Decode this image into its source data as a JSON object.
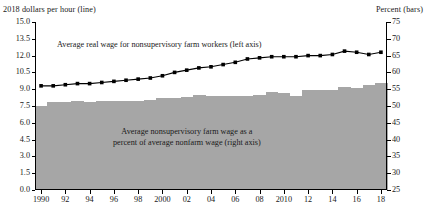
{
  "chart_data": {
    "type": "bar",
    "title": "",
    "left_axis_title": "2018 dollars per hour (line)",
    "right_axis_title": "Percent (bars)",
    "xlabel": "",
    "categories": [
      1990,
      1991,
      1992,
      1993,
      1994,
      1995,
      1996,
      1997,
      1998,
      1999,
      2000,
      2001,
      2002,
      2003,
      2004,
      2005,
      2006,
      2007,
      2008,
      2009,
      2010,
      2011,
      2012,
      2013,
      2014,
      2015,
      2016,
      2017,
      2018
    ],
    "x_tick_labels": [
      "1990",
      "92",
      "94",
      "96",
      "98",
      "2000",
      "02",
      "04",
      "06",
      "08",
      "2010",
      "12",
      "14",
      "16",
      "18"
    ],
    "x_tick_values": [
      1990,
      1992,
      1994,
      1996,
      1998,
      2000,
      2002,
      2004,
      2006,
      2008,
      2010,
      2012,
      2014,
      2016,
      2018
    ],
    "left_ylabel": "2018 dollars per hour",
    "left_ylim": [
      0.0,
      15.0
    ],
    "left_ticks": [
      "0.0",
      "1.5",
      "3.0",
      "4.5",
      "6.0",
      "7.5",
      "9.0",
      "10.5",
      "12.0",
      "13.5",
      "15.0"
    ],
    "left_tick_values": [
      0.0,
      1.5,
      3.0,
      4.5,
      6.0,
      7.5,
      9.0,
      10.5,
      12.0,
      13.5,
      15.0
    ],
    "right_ylabel": "Percent",
    "right_ylim": [
      25,
      75
    ],
    "right_ticks": [
      "25",
      "30",
      "35",
      "40",
      "45",
      "50",
      "55",
      "60",
      "65",
      "70",
      "75"
    ],
    "right_tick_values": [
      25,
      30,
      35,
      40,
      45,
      50,
      55,
      60,
      65,
      70,
      75
    ],
    "grid": false,
    "legend": "annotations",
    "series": [
      {
        "name": "Average real wage for nonsupervisory farm workers (left axis)",
        "type": "line",
        "axis": "left",
        "marker": "square",
        "color": "#000000",
        "values": [
          9.3,
          9.3,
          9.4,
          9.5,
          9.5,
          9.6,
          9.7,
          9.8,
          9.9,
          10.0,
          10.2,
          10.5,
          10.7,
          10.9,
          11.0,
          11.2,
          11.4,
          11.7,
          11.8,
          11.9,
          11.9,
          11.9,
          12.0,
          12.0,
          12.1,
          12.4,
          12.3,
          12.1,
          12.3
        ]
      },
      {
        "name": "Average nonsupervisory farm wage as a percent of average nonfarm wage (right axis)",
        "type": "bar",
        "axis": "right",
        "color": "#a6a6a6",
        "values": [
          50.0,
          51.2,
          51.3,
          51.4,
          51.3,
          51.4,
          51.5,
          51.5,
          51.6,
          51.7,
          52.4,
          52.5,
          52.8,
          53.2,
          52.9,
          52.9,
          52.9,
          53.0,
          53.3,
          54.3,
          54.0,
          53.1,
          54.8,
          54.9,
          54.9,
          55.6,
          55.5,
          56.3,
          56.8
        ]
      }
    ],
    "annotations": [
      {
        "id": "line-annotation",
        "text": "Average real wage for nonsupervisory farm workers (left axis)"
      },
      {
        "id": "bars-annotation-line1",
        "text": "Average nonsupervisory farm wage as a"
      },
      {
        "id": "bars-annotation-line2",
        "text": "percent of average nonfarm wage (right axis)"
      }
    ],
    "colors": {
      "bar": "#a6a6a6",
      "line": "#000000",
      "axis": "#000000",
      "background": "#ffffff"
    }
  }
}
